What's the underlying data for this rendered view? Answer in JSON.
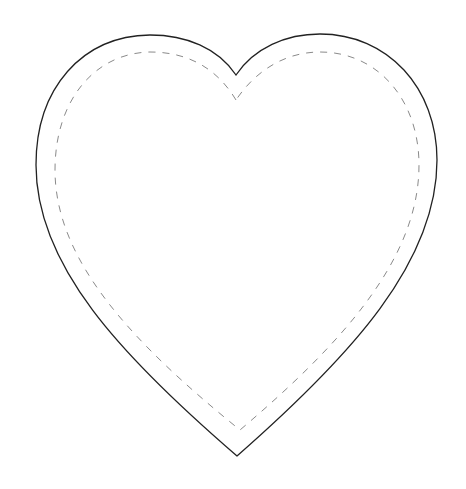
{
  "figure": {
    "title": "Heart outline template",
    "colors": {
      "background": "#ffffff",
      "outline": "#222222",
      "dashed_line": "#8a8a8a"
    },
    "shapes": [
      {
        "name": "heart-outline",
        "style": "solid"
      },
      {
        "name": "heart-stitch-line",
        "style": "dashed"
      }
    ]
  }
}
